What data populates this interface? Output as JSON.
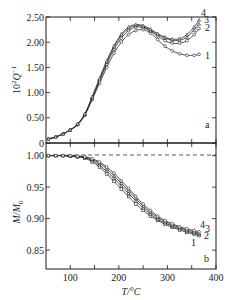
{
  "chart_data": [
    {
      "panel": "a",
      "type": "line",
      "title": "",
      "xlabel": "T/°C",
      "ylabel": "10²Q⁻¹",
      "xlim": [
        50,
        400
      ],
      "ylim": [
        0,
        2.5
      ],
      "xticks": [
        100,
        150,
        200,
        250,
        300,
        350,
        400
      ],
      "yticks": [
        0,
        0.5,
        1.0,
        1.5,
        2.0,
        2.5
      ],
      "ytick_labels": [
        "0",
        "0.50",
        "1.00",
        "1.50",
        "2.00",
        "2.50"
      ],
      "grid": false,
      "panel_label": "a",
      "x": [
        55,
        70,
        85,
        100,
        115,
        130,
        145,
        160,
        175,
        190,
        205,
        220,
        235,
        250,
        265,
        280,
        295,
        310,
        325,
        340,
        355,
        365
      ],
      "series": [
        {
          "name": "1",
          "values": [
            0.08,
            0.12,
            0.18,
            0.26,
            0.36,
            0.55,
            0.86,
            1.18,
            1.5,
            1.78,
            2.0,
            2.15,
            2.23,
            2.25,
            2.18,
            2.05,
            1.92,
            1.83,
            1.77,
            1.74,
            1.74,
            1.76
          ]
        },
        {
          "name": "2",
          "values": [
            0.08,
            0.12,
            0.18,
            0.26,
            0.37,
            0.56,
            0.88,
            1.22,
            1.56,
            1.86,
            2.08,
            2.23,
            2.3,
            2.29,
            2.22,
            2.12,
            2.03,
            1.98,
            1.98,
            2.03,
            2.15,
            2.27
          ]
        },
        {
          "name": "3",
          "values": [
            0.08,
            0.12,
            0.18,
            0.26,
            0.37,
            0.57,
            0.9,
            1.26,
            1.6,
            1.9,
            2.13,
            2.27,
            2.33,
            2.31,
            2.24,
            2.15,
            2.08,
            2.04,
            2.04,
            2.1,
            2.24,
            2.36
          ]
        },
        {
          "name": "4",
          "values": [
            0.08,
            0.12,
            0.18,
            0.26,
            0.38,
            0.58,
            0.92,
            1.28,
            1.63,
            1.93,
            2.16,
            2.3,
            2.35,
            2.33,
            2.26,
            2.17,
            2.1,
            2.06,
            2.07,
            2.15,
            2.3,
            2.44
          ]
        }
      ]
    },
    {
      "panel": "b",
      "type": "line",
      "title": "",
      "xlabel": "T/°C",
      "ylabel": "M/M₀",
      "xlim": [
        50,
        400
      ],
      "ylim": [
        0.82,
        1.02
      ],
      "xticks": [
        100,
        150,
        200,
        250,
        300,
        350,
        400
      ],
      "xtick_labels": [
        "100",
        "200",
        "300",
        "400"
      ],
      "yticks": [
        0.85,
        0.9,
        0.95,
        1.0
      ],
      "ytick_labels": [
        "0.85",
        "0.90",
        "0.95",
        "1.00"
      ],
      "reference_line": {
        "y": 1.0,
        "style": "dashed"
      },
      "grid": false,
      "panel_label": "b",
      "x": [
        55,
        70,
        85,
        100,
        115,
        130,
        145,
        160,
        175,
        190,
        205,
        220,
        235,
        250,
        265,
        280,
        295,
        310,
        325,
        340,
        355,
        365
      ],
      "series": [
        {
          "name": "1",
          "values": [
            1.0,
            1.0,
            1.0,
            0.999,
            0.998,
            0.996,
            0.99,
            0.982,
            0.971,
            0.959,
            0.947,
            0.935,
            0.923,
            0.913,
            0.904,
            0.897,
            0.891,
            0.886,
            0.882,
            0.878,
            0.875,
            0.873
          ]
        },
        {
          "name": "2",
          "values": [
            1.0,
            1.0,
            1.0,
            0.999,
            0.998,
            0.997,
            0.992,
            0.985,
            0.975,
            0.964,
            0.952,
            0.94,
            0.928,
            0.917,
            0.907,
            0.899,
            0.893,
            0.888,
            0.884,
            0.88,
            0.877,
            0.875
          ]
        },
        {
          "name": "3",
          "values": [
            1.0,
            1.0,
            1.0,
            1.0,
            0.999,
            0.998,
            0.994,
            0.988,
            0.979,
            0.968,
            0.956,
            0.944,
            0.932,
            0.92,
            0.91,
            0.902,
            0.895,
            0.89,
            0.886,
            0.882,
            0.879,
            0.877
          ]
        },
        {
          "name": "4",
          "values": [
            1.0,
            1.0,
            1.0,
            1.0,
            0.999,
            0.998,
            0.995,
            0.99,
            0.982,
            0.972,
            0.96,
            0.948,
            0.935,
            0.923,
            0.913,
            0.904,
            0.897,
            0.892,
            0.887,
            0.884,
            0.881,
            0.879
          ]
        }
      ]
    }
  ],
  "axes": {
    "xlabel": "T/°C",
    "panel_a": {
      "ylabel_base": "10",
      "ylabel_sup": "2",
      "ylabel_main": "Q",
      "ylabel_exp": "−1",
      "label": "a"
    },
    "panel_b": {
      "ylabel_main": "M/M",
      "ylabel_sub": "0",
      "label": "b"
    }
  },
  "colors": {
    "line": "#2a2a2a",
    "frame": "#1a1a1a",
    "dash": "#333333"
  }
}
